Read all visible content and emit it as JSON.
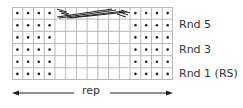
{
  "chart": {
    "columns": 15,
    "rows": 6,
    "dot_columns_left": 4,
    "dot_columns_right": 4,
    "cable_columns": 7,
    "cable_row": 1,
    "grid_color": "#b8b8b8",
    "dot_color": "#222222",
    "line_color": "#222222"
  },
  "row_labels": [
    {
      "label": "Rnd 5",
      "row": 2
    },
    {
      "label": "Rnd 3",
      "row": 4
    },
    {
      "label": "Rnd 1 (RS)",
      "row": 6
    }
  ],
  "repeat": {
    "label": "rep"
  }
}
